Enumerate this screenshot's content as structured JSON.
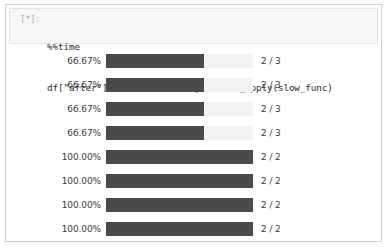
{
  "cell": {
    "prompt": "[*]:",
    "code_lines": [
      "%%time",
      "df[\"after\"] = df[\"before\"].parallel_apply(slow_func)"
    ]
  },
  "colors": {
    "bar_fill": "#4a4a4a",
    "bar_track": "#f2f2f2",
    "cell_background": "#f7f7f7",
    "frame_border": "#d0d0d0",
    "text": "#3a3a3a",
    "prompt_text": "#a8a8a8"
  },
  "output": {
    "progress_bars": [
      {
        "percent_label": "66.67%",
        "percent_value": 66.67,
        "count_label": "2 / 3"
      },
      {
        "percent_label": "66.67%",
        "percent_value": 66.67,
        "count_label": "2 / 3"
      },
      {
        "percent_label": "66.67%",
        "percent_value": 66.67,
        "count_label": "2 / 3"
      },
      {
        "percent_label": "66.67%",
        "percent_value": 66.67,
        "count_label": "2 / 3"
      },
      {
        "percent_label": "100.00%",
        "percent_value": 100.0,
        "count_label": "2 / 2"
      },
      {
        "percent_label": "100.00%",
        "percent_value": 100.0,
        "count_label": "2 / 2"
      },
      {
        "percent_label": "100.00%",
        "percent_value": 100.0,
        "count_label": "2 / 2"
      },
      {
        "percent_label": "100.00%",
        "percent_value": 100.0,
        "count_label": "2 / 2"
      }
    ]
  }
}
